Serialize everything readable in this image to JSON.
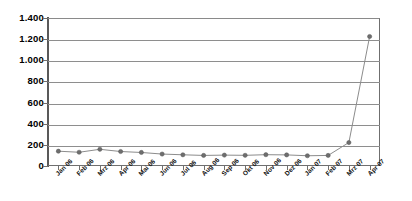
{
  "chart_data": {
    "type": "line",
    "title": "",
    "subtitle": "",
    "xlabel": "",
    "ylabel": "",
    "categories": [
      "Jan 06",
      "Feb 06",
      "Mrz 06",
      "Apr 06",
      "Mai 06",
      "Jun 06",
      "Jul 06",
      "Aug 06",
      "Sep 06",
      "Okt 06",
      "Nov 06",
      "Dez 06",
      "Jan 07",
      "Feb 07",
      "Mrz 07",
      "Apr 07"
    ],
    "values": [
      140,
      130,
      158,
      137,
      128,
      113,
      106,
      100,
      103,
      101,
      107,
      105,
      97,
      100,
      222,
      1225
    ],
    "ylim": [
      0,
      1400
    ],
    "ytick_values": [
      0,
      200,
      400,
      600,
      800,
      1000,
      1200,
      1400
    ],
    "ytick_labels": [
      "0",
      "200",
      "400",
      "600",
      "800",
      "1.000",
      "1.200",
      "1.400"
    ],
    "grid": true,
    "legend": false,
    "legend_position": "none",
    "series": [
      {
        "name": "",
        "values": [
          140,
          130,
          158,
          137,
          128,
          113,
          106,
          100,
          103,
          101,
          107,
          105,
          97,
          100,
          222,
          1225
        ]
      }
    ],
    "colors": {
      "line": "#8c8c8c",
      "marker": "#6e6e6e",
      "gridline": "#8e8e8e",
      "axis": "#595959",
      "background": "#ffffff",
      "text": "#000000"
    }
  }
}
